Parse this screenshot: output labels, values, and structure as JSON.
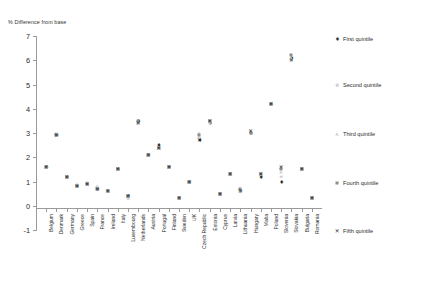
{
  "chart_data": {
    "type": "scatter",
    "title": "",
    "ylabel": "% Difference from base",
    "xlabel": "",
    "ylim": [
      -1,
      7
    ],
    "yticks": [
      -1,
      0,
      1,
      2,
      3,
      4,
      5,
      6,
      7
    ],
    "grid": false,
    "legend_position": "right",
    "categories": [
      "Belgium",
      "Denmark",
      "Germany",
      "Greece",
      "Spain",
      "France",
      "Ireland",
      "Italy",
      "Luxembourg",
      "Netherlands",
      "Austria",
      "Portugal",
      "Finland",
      "Sweden",
      "UK",
      "Czech Republic",
      "Estonia",
      "Cyprus",
      "Latvia",
      "Lithuania",
      "Hungary",
      "Malta",
      "Poland",
      "Slovenia",
      "Slovakia",
      "Bulgaria",
      "Romania"
    ],
    "series": [
      {
        "name": "First quintile",
        "marker": "diamond-dark",
        "color": "#2e2e2e",
        "values": [
          1.6,
          2.9,
          1.2,
          0.8,
          0.9,
          0.7,
          0.6,
          1.5,
          0.4,
          3.5,
          2.1,
          2.5,
          1.6,
          0.3,
          1.0,
          2.7,
          3.4,
          0.5,
          1.3,
          0.6,
          3.0,
          1.2,
          4.2,
          1.0,
          6.1,
          1.5,
          0.3
        ]
      },
      {
        "name": "Second quintile",
        "marker": "square-light",
        "color": "#cfcfcf",
        "values": [
          1.6,
          2.9,
          1.2,
          0.8,
          0.9,
          0.7,
          0.6,
          1.5,
          0.3,
          3.4,
          2.1,
          2.4,
          1.6,
          0.3,
          1.0,
          2.8,
          3.4,
          0.5,
          1.3,
          0.6,
          3.0,
          1.3,
          4.2,
          1.2,
          6.0,
          1.5,
          0.3
        ]
      },
      {
        "name": "Third quintile",
        "marker": "triangle-light",
        "color": "#d2d2d2",
        "values": [
          1.6,
          3.0,
          1.2,
          0.9,
          1.0,
          0.8,
          0.6,
          1.5,
          0.4,
          3.4,
          2.1,
          2.4,
          1.6,
          0.3,
          1.0,
          3.0,
          3.5,
          0.5,
          1.3,
          0.7,
          3.0,
          1.3,
          4.2,
          1.4,
          6.1,
          1.5,
          0.3
        ]
      },
      {
        "name": "Fourth quintile",
        "marker": "square-medium",
        "color": "#8e8e8e",
        "values": [
          1.6,
          2.9,
          1.2,
          0.8,
          0.9,
          0.7,
          0.6,
          1.5,
          0.4,
          3.5,
          2.1,
          2.4,
          1.6,
          0.3,
          1.0,
          2.9,
          3.5,
          0.5,
          1.3,
          0.7,
          3.0,
          1.3,
          4.2,
          1.5,
          6.2,
          1.5,
          0.3
        ]
      },
      {
        "name": "Fifth quintile",
        "marker": "x-dark",
        "color": "#1e1e1e",
        "values": [
          1.6,
          2.9,
          1.2,
          0.8,
          0.9,
          0.7,
          0.6,
          1.5,
          0.4,
          3.4,
          2.1,
          2.4,
          1.6,
          0.3,
          1.0,
          2.7,
          3.5,
          0.5,
          1.3,
          0.6,
          3.1,
          1.3,
          4.2,
          1.6,
          6.0,
          1.5,
          0.3
        ]
      }
    ]
  },
  "legend": {
    "items": [
      {
        "label": "First quintile"
      },
      {
        "label": "Second quintile"
      },
      {
        "label": "Third quintile"
      },
      {
        "label": "Fourth quintile"
      },
      {
        "label": "Fifth quintile"
      }
    ]
  },
  "markers": {
    "first": "♦",
    "fifth": "✕"
  }
}
